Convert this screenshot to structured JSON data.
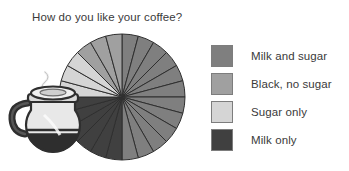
{
  "chart_data": {
    "type": "pie",
    "title": "How do you like your coffee?",
    "xlabel": "",
    "ylabel": "",
    "legend_position": "right",
    "grid": false,
    "categories": [
      "Milk and sugar",
      "Black, no sugar",
      "Sugar only",
      "Milk only"
    ],
    "values": [
      50,
      12.5,
      12.5,
      25
    ],
    "colors": [
      "#7f7f7f",
      "#a0a0a0",
      "#d5d5d5",
      "#404040"
    ],
    "segments": 24,
    "segment_degrees": 15,
    "start_angle_deg": -90,
    "slice_sequence": [
      "Milk and sugar",
      "Milk and sugar",
      "Milk and sugar",
      "Milk and sugar",
      "Milk and sugar",
      "Milk and sugar",
      "Milk and sugar",
      "Milk and sugar",
      "Milk and sugar",
      "Milk and sugar",
      "Milk and sugar",
      "Milk and sugar",
      "Milk only",
      "Milk only",
      "Milk only",
      "Milk only",
      "Milk only",
      "Milk only",
      "Sugar only",
      "Sugar only",
      "Sugar only",
      "Black, no sugar",
      "Black, no sugar",
      "Black, no sugar"
    ]
  },
  "chart": {
    "title": "How do you like your coffee?"
  },
  "legend": {
    "items": [
      {
        "label": "Milk and sugar",
        "color": "#7f7f7f"
      },
      {
        "label": "Black, no sugar",
        "color": "#a0a0a0"
      },
      {
        "label": "Sugar only",
        "color": "#d5d5d5"
      },
      {
        "label": "Milk only",
        "color": "#404040"
      }
    ]
  },
  "illustration": {
    "name": "coffee-pot"
  }
}
